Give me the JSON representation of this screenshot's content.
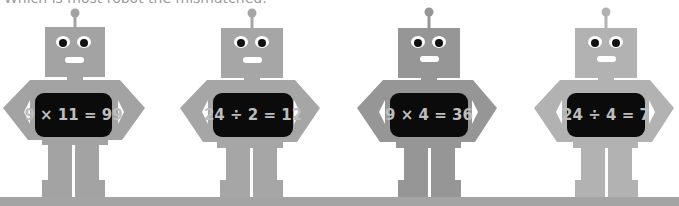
{
  "question": "Which is most robot the mismatched.",
  "robots": [
    {
      "equation": "9 × 11 = 99",
      "color": "#a3a3a3"
    },
    {
      "equation": "24 ÷ 2 = 12",
      "color": "#a6a6a6"
    },
    {
      "equation": "9 × 4 = 36",
      "color": "#969696"
    },
    {
      "equation": "24 ÷ 4 = 7",
      "color": "#b2b2b2"
    }
  ],
  "colors": {
    "screen": "#0b0b0b",
    "text": "#bdbdbd",
    "ground": "#a4a4a4"
  }
}
